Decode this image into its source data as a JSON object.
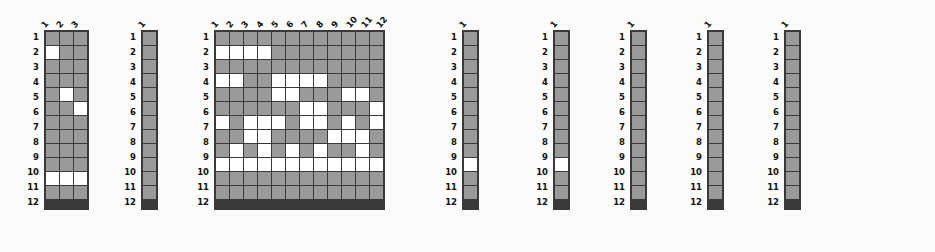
{
  "figure": {
    "title_visible": false,
    "background_color": "#fbfbfa",
    "filled_color": "#9a9a9a",
    "empty_color": "#ffffff",
    "gridline_color": "#3a3a3a",
    "row_labels": [
      "1",
      "2",
      "3",
      "4",
      "5",
      "6",
      "7",
      "8",
      "9",
      "10",
      "11",
      "12"
    ],
    "matrices": [
      {
        "name": "matrix-1",
        "columns": 3,
        "rows": 12,
        "col_labels": [
          "1",
          "2",
          "3"
        ],
        "cells": [
          [
            1,
            1,
            1
          ],
          [
            0,
            1,
            1
          ],
          [
            1,
            1,
            1
          ],
          [
            1,
            1,
            1
          ],
          [
            1,
            0,
            1
          ],
          [
            1,
            1,
            0
          ],
          [
            1,
            1,
            1
          ],
          [
            1,
            1,
            1
          ],
          [
            1,
            1,
            1
          ],
          [
            1,
            1,
            1
          ],
          [
            0,
            0,
            0
          ],
          [
            1,
            1,
            1
          ]
        ]
      },
      {
        "name": "matrix-2",
        "columns": 1,
        "rows": 12,
        "col_labels": [
          "1"
        ],
        "cells": [
          [
            1
          ],
          [
            1
          ],
          [
            1
          ],
          [
            1
          ],
          [
            1
          ],
          [
            1
          ],
          [
            1
          ],
          [
            1
          ],
          [
            1
          ],
          [
            1
          ],
          [
            1
          ],
          [
            1
          ]
        ]
      },
      {
        "name": "matrix-3",
        "columns": 12,
        "rows": 12,
        "col_labels": [
          "1",
          "2",
          "3",
          "4",
          "5",
          "6",
          "7",
          "8",
          "9",
          "10",
          "11",
          "12"
        ],
        "cells": [
          [
            1,
            1,
            1,
            1,
            1,
            1,
            1,
            1,
            1,
            1,
            1,
            1
          ],
          [
            0,
            0,
            0,
            0,
            1,
            1,
            1,
            1,
            1,
            1,
            1,
            1
          ],
          [
            1,
            1,
            1,
            1,
            1,
            1,
            1,
            1,
            1,
            1,
            1,
            1
          ],
          [
            0,
            0,
            1,
            1,
            0,
            0,
            0,
            0,
            1,
            1,
            1,
            1
          ],
          [
            1,
            1,
            1,
            1,
            0,
            0,
            1,
            1,
            1,
            0,
            0,
            1
          ],
          [
            1,
            1,
            1,
            1,
            1,
            1,
            0,
            0,
            1,
            1,
            1,
            0
          ],
          [
            0,
            1,
            0,
            0,
            0,
            1,
            0,
            0,
            1,
            0,
            1,
            0
          ],
          [
            1,
            1,
            0,
            0,
            1,
            1,
            1,
            1,
            0,
            0,
            0,
            1
          ],
          [
            1,
            0,
            1,
            0,
            1,
            0,
            1,
            0,
            1,
            1,
            0,
            1
          ],
          [
            0,
            0,
            0,
            0,
            0,
            0,
            0,
            0,
            0,
            0,
            0,
            0
          ],
          [
            1,
            1,
            1,
            1,
            1,
            1,
            1,
            1,
            1,
            1,
            1,
            1
          ],
          [
            1,
            1,
            1,
            1,
            1,
            1,
            1,
            1,
            1,
            1,
            1,
            1
          ]
        ]
      },
      {
        "name": "matrix-4",
        "columns": 1,
        "rows": 12,
        "col_labels": [
          "1"
        ],
        "cells": [
          [
            1
          ],
          [
            1
          ],
          [
            1
          ],
          [
            1
          ],
          [
            1
          ],
          [
            1
          ],
          [
            1
          ],
          [
            1
          ],
          [
            1
          ],
          [
            0
          ],
          [
            1
          ],
          [
            1
          ]
        ]
      },
      {
        "name": "matrix-5",
        "columns": 1,
        "rows": 12,
        "col_labels": [
          "1"
        ],
        "cells": [
          [
            1
          ],
          [
            1
          ],
          [
            1
          ],
          [
            1
          ],
          [
            1
          ],
          [
            1
          ],
          [
            1
          ],
          [
            1
          ],
          [
            1
          ],
          [
            0
          ],
          [
            1
          ],
          [
            1
          ]
        ]
      },
      {
        "name": "matrix-6",
        "columns": 1,
        "rows": 12,
        "col_labels": [
          "1"
        ],
        "cells": [
          [
            1
          ],
          [
            1
          ],
          [
            1
          ],
          [
            1
          ],
          [
            1
          ],
          [
            1
          ],
          [
            1
          ],
          [
            1
          ],
          [
            1
          ],
          [
            1
          ],
          [
            1
          ],
          [
            1
          ]
        ]
      },
      {
        "name": "matrix-7",
        "columns": 1,
        "rows": 12,
        "col_labels": [
          "1"
        ],
        "cells": [
          [
            1
          ],
          [
            1
          ],
          [
            1
          ],
          [
            1
          ],
          [
            1
          ],
          [
            1
          ],
          [
            1
          ],
          [
            1
          ],
          [
            1
          ],
          [
            1
          ],
          [
            1
          ],
          [
            1
          ]
        ]
      },
      {
        "name": "matrix-8",
        "columns": 1,
        "rows": 12,
        "col_labels": [
          "1"
        ],
        "cells": [
          [
            1
          ],
          [
            1
          ],
          [
            1
          ],
          [
            1
          ],
          [
            1
          ],
          [
            1
          ],
          [
            1
          ],
          [
            1
          ],
          [
            1
          ],
          [
            1
          ],
          [
            1
          ],
          [
            1
          ]
        ]
      }
    ]
  }
}
